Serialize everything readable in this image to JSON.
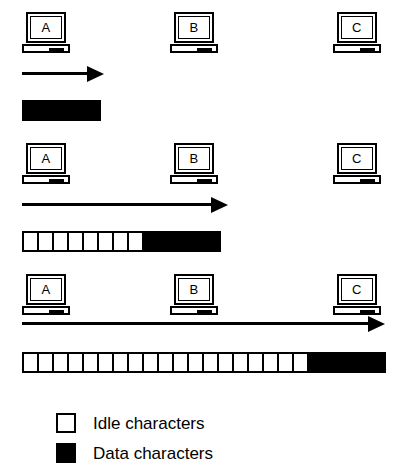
{
  "diagram": {
    "stations": [
      "A",
      "B",
      "C"
    ],
    "legend": [
      {
        "swatch": "white",
        "label": "Idle characters"
      },
      {
        "swatch": "black",
        "label": "Data characters"
      }
    ],
    "rows": [
      {
        "name": "row-1",
        "stations": [
          {
            "label": "A",
            "x": 22
          },
          {
            "label": "B",
            "x": 170
          },
          {
            "label": "C",
            "x": 333
          }
        ],
        "arrow": {
          "x": 22,
          "width": 82
        },
        "bar": {
          "x": 22,
          "idle_cells": 0,
          "data_cells": 5,
          "cell_width": 15,
          "total_cells": 5
        }
      },
      {
        "name": "row-2",
        "stations": [
          {
            "label": "A",
            "x": 22
          },
          {
            "label": "B",
            "x": 170
          },
          {
            "label": "C",
            "x": 333
          }
        ],
        "arrow": {
          "x": 22,
          "width": 206
        },
        "bar": {
          "x": 22,
          "idle_cells": 8,
          "data_cells": 5,
          "cell_width": 15,
          "total_cells": 13
        }
      },
      {
        "name": "row-3",
        "stations": [
          {
            "label": "A",
            "x": 22
          },
          {
            "label": "B",
            "x": 170
          },
          {
            "label": "C",
            "x": 333
          }
        ],
        "arrow": {
          "x": 22,
          "width": 363
        },
        "bar": {
          "x": 22,
          "idle_cells": 19,
          "data_cells": 5,
          "cell_width": 15,
          "total_cells": 24
        }
      }
    ]
  },
  "colors": {
    "stroke": "#000000",
    "idle": "#ffffff",
    "data": "#000000",
    "background": "#ffffff"
  }
}
